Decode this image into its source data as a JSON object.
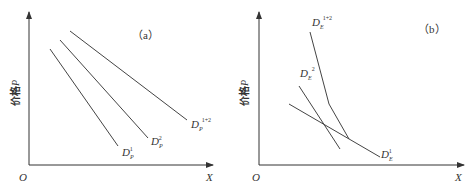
{
  "panels": [
    {
      "id": "a",
      "tag": "（a）",
      "ylabel": "价格",
      "ylabel_var": "P",
      "origin": "O",
      "xlabel": "X",
      "curves": [
        {
          "name": "D_P^1",
          "base": "D",
          "sub": "P",
          "sup": "1"
        },
        {
          "name": "D_P^2",
          "base": "D",
          "sub": "P",
          "sup": "2"
        },
        {
          "name": "D_P^{1+2}",
          "base": "D",
          "sub": "P",
          "sup": "1+2"
        }
      ]
    },
    {
      "id": "b",
      "tag": "（b）",
      "ylabel": "价格",
      "ylabel_var": "P",
      "origin": "O",
      "xlabel": "X",
      "curves": [
        {
          "name": "D_E^1",
          "base": "D",
          "sub": "E",
          "sup": "1"
        },
        {
          "name": "D_E^2",
          "base": "D",
          "sub": "E",
          "sup": "2"
        },
        {
          "name": "D_E^{1+2}",
          "base": "D",
          "sub": "E",
          "sup": "1+2"
        }
      ]
    }
  ],
  "colors": {
    "line": "#444444",
    "axis": "#333333",
    "background": "#ffffff"
  }
}
